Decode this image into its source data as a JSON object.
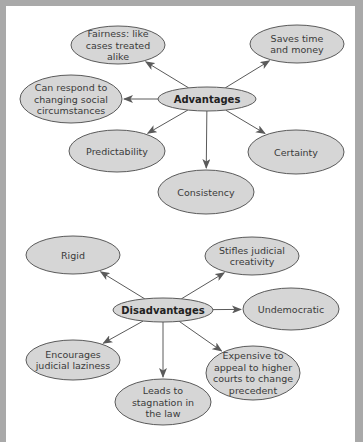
{
  "diagrams": [
    {
      "id": "advantages",
      "hub": {
        "label": "Advantages"
      },
      "nodes": [
        {
          "key": "fairness",
          "lines": [
            "Fairness: like",
            "cases treated",
            "alike"
          ]
        },
        {
          "key": "saves",
          "lines": [
            "Saves time",
            "and money"
          ]
        },
        {
          "key": "respond",
          "lines": [
            "Can respond to",
            "changing social",
            "circumstances"
          ]
        },
        {
          "key": "predictability",
          "lines": [
            "Predictability"
          ]
        },
        {
          "key": "certainty",
          "lines": [
            "Certainty"
          ]
        },
        {
          "key": "consistency",
          "lines": [
            "Consistency"
          ]
        }
      ]
    },
    {
      "id": "disadvantages",
      "hub": {
        "label": "Disadvantages"
      },
      "nodes": [
        {
          "key": "rigid",
          "lines": [
            "Rigid"
          ]
        },
        {
          "key": "stifles",
          "lines": [
            "Stifles judicial",
            "creativity"
          ]
        },
        {
          "key": "undemocratic",
          "lines": [
            "Undemocratic"
          ]
        },
        {
          "key": "encourages",
          "lines": [
            "Encourages",
            "judicial laziness"
          ]
        },
        {
          "key": "expensive",
          "lines": [
            "Expensive to",
            "appeal to higher",
            "courts to change",
            "precedent"
          ]
        },
        {
          "key": "leads",
          "lines": [
            "Leads to",
            "stagnation in",
            "the law"
          ]
        }
      ]
    }
  ]
}
